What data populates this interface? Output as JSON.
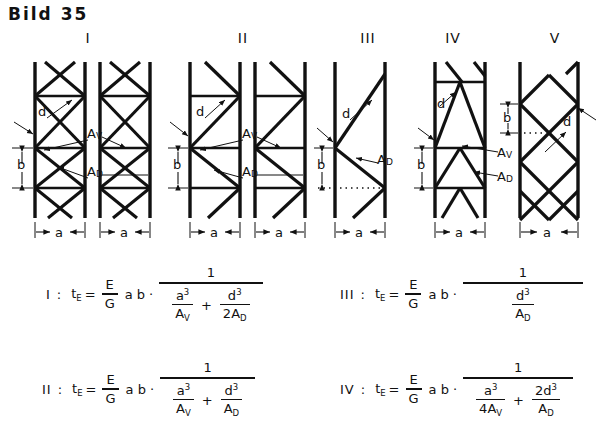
{
  "figure": {
    "title": "Bild 35",
    "panels": [
      {
        "label": "I",
        "type": "cross-bracing-with-horizontals",
        "annotations": {
          "d": "d",
          "b": "b",
          "a": "a",
          "av": "A",
          "av_sub": "V",
          "ad": "A",
          "ad_sub": "D"
        }
      },
      {
        "label": "II",
        "type": "single-diagonal-with-horizontals",
        "annotations": {
          "d": "d",
          "b": "b",
          "a": "a",
          "av": "A",
          "av_sub": "V",
          "ad": "A",
          "ad_sub": "D"
        }
      },
      {
        "label": "III",
        "type": "zigzag-diagonals-only",
        "annotations": {
          "d": "d",
          "b": "b",
          "a": "a",
          "ad": "A",
          "ad_sub": "D"
        }
      },
      {
        "label": "IV",
        "type": "k-bracing-with-horizontals",
        "annotations": {
          "d": "d",
          "b": "b",
          "a": "a",
          "av": "A",
          "av_sub": "V",
          "ad": "A",
          "ad_sub": "D"
        }
      },
      {
        "label": "V",
        "type": "diamond-lattice",
        "annotations": {
          "d": "d",
          "b": "b",
          "a": "a"
        }
      }
    ]
  },
  "formulas": [
    {
      "id": "I",
      "number": "I",
      "colon": ":",
      "lhs": "t",
      "lhs_sub": "E",
      "equals": "=",
      "modulus_num": "E",
      "modulus_den": "G",
      "ab": "a b",
      "dot": "·",
      "numerator": "1",
      "terms": [
        {
          "num_base": "a",
          "num_exp": "3",
          "den": "A",
          "den_sub": "V",
          "den_coeff": ""
        },
        {
          "num_base": "d",
          "num_exp": "3",
          "den": "A",
          "den_sub": "D",
          "den_coeff": "2"
        }
      ],
      "operator": "+"
    },
    {
      "id": "II",
      "number": "II",
      "colon": ":",
      "lhs": "t",
      "lhs_sub": "E",
      "equals": "=",
      "modulus_num": "E",
      "modulus_den": "G",
      "ab": "a b",
      "dot": "·",
      "numerator": "1",
      "terms": [
        {
          "num_base": "a",
          "num_exp": "3",
          "den": "A",
          "den_sub": "V",
          "den_coeff": ""
        },
        {
          "num_base": "d",
          "num_exp": "3",
          "den": "A",
          "den_sub": "D",
          "den_coeff": ""
        }
      ],
      "operator": "+"
    },
    {
      "id": "III",
      "number": "III",
      "colon": ":",
      "lhs": "t",
      "lhs_sub": "E",
      "equals": "=",
      "modulus_num": "E",
      "modulus_den": "G",
      "ab": "a b",
      "dot": "·",
      "numerator": "1",
      "terms": [
        {
          "num_base": "d",
          "num_exp": "3",
          "den": "A",
          "den_sub": "D",
          "den_coeff": ""
        }
      ],
      "operator": ""
    },
    {
      "id": "IV",
      "number": "IV",
      "colon": ":",
      "lhs": "t",
      "lhs_sub": "E",
      "equals": "=",
      "modulus_num": "E",
      "modulus_den": "G",
      "ab": "a b",
      "dot": "·",
      "numerator": "1",
      "terms": [
        {
          "num_base": "a",
          "num_exp": "3",
          "den": "A",
          "den_sub": "V",
          "den_coeff": "4",
          "den_prefix": true
        },
        {
          "num_base": "d",
          "num_exp": "3",
          "den": "A",
          "den_sub": "D",
          "num_coeff": "2"
        }
      ],
      "operator": "+"
    }
  ],
  "colors": {
    "ink": "#111111",
    "paper": "#ffffff"
  }
}
